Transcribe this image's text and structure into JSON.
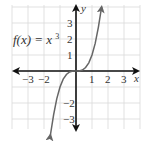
{
  "chart_data": {
    "type": "line",
    "title": "",
    "function_label": "f(x) = x³",
    "function_label_parts": {
      "lhs": "f(x) =",
      "base": "x",
      "exp": "3"
    },
    "xlabel": "x",
    "ylabel": "y",
    "xlim": [
      -4,
      4
    ],
    "ylim": [
      -4,
      4
    ],
    "grid": true,
    "x_tick_labels": [
      "−3",
      "−2",
      "1",
      "2",
      "3"
    ],
    "x_tick_values": [
      -3,
      -2,
      1,
      2,
      3
    ],
    "y_tick_labels": [
      "3",
      "2",
      "1",
      "−2",
      "−3"
    ],
    "y_tick_values": [
      3,
      2,
      1,
      -2,
      -3
    ],
    "series": [
      {
        "name": "f(x) = x^3",
        "x": [
          -1.6,
          -1.4,
          -1.2,
          -1.0,
          -0.8,
          -0.6,
          -0.4,
          -0.2,
          0,
          0.2,
          0.4,
          0.6,
          0.8,
          1.0,
          1.2,
          1.4,
          1.6
        ],
        "y": [
          -4.096,
          -2.744,
          -1.728,
          -1.0,
          -0.512,
          -0.216,
          -0.064,
          -0.008,
          0,
          0.008,
          0.064,
          0.216,
          0.512,
          1.0,
          1.728,
          2.744,
          4.096
        ],
        "arrows_both_ends": true
      }
    ],
    "colors": {
      "curve": "#666666",
      "axes": "#111111",
      "grid": "#d9d9d9",
      "text": "#333333"
    }
  }
}
